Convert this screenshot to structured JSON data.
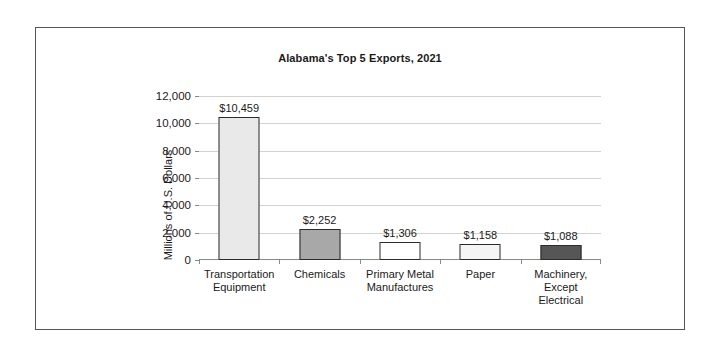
{
  "chart_data": {
    "type": "bar",
    "title": "Alabama's Top 5 Exports, 2021",
    "xlabel": "",
    "ylabel": "Millions of U.S. Dollars",
    "categories": [
      "Transportation Equipment",
      "Chemicals",
      "Primary Metal Manufactures",
      "Paper",
      "Machinery, Except Electrical"
    ],
    "category_lines": [
      [
        "Transportation",
        "Equipment"
      ],
      [
        "Chemicals"
      ],
      [
        "Primary Metal",
        "Manufactures"
      ],
      [
        "Paper"
      ],
      [
        "Machinery,",
        "Except",
        "Electrical"
      ]
    ],
    "values": [
      10459,
      2252,
      1306,
      1158,
      1088
    ],
    "value_labels": [
      "$10,459",
      "$2,252",
      "$1,306",
      "$1,158",
      "$1,088"
    ],
    "bar_colors": [
      "#e9e9e9",
      "#a8a8a8",
      "#ffffff",
      "#f4f4f4",
      "#565656"
    ],
    "bar_border_color": "#2b2b2b",
    "ylim": [
      0,
      12000
    ],
    "ytick_values": [
      0,
      2000,
      4000,
      6000,
      8000,
      10000,
      12000
    ],
    "ytick_labels": [
      "0",
      "2,000",
      "4,000",
      "6,000",
      "8,000",
      "10,000",
      "12,000"
    ],
    "grid": "horizontal",
    "legend": "none",
    "gridline_color": "#d2d2d2",
    "axis_color": "#8a8a8a",
    "plot_background": "#ffffff"
  }
}
